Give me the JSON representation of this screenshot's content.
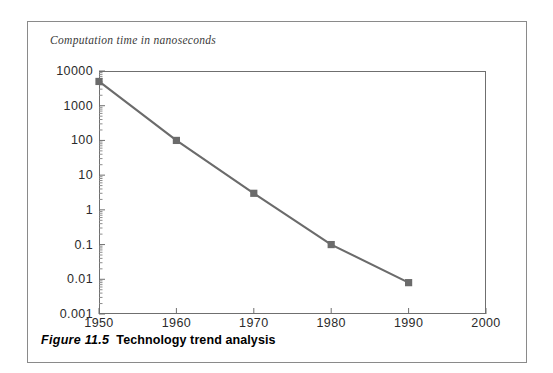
{
  "figure": {
    "caption_number": "Figure 11.5",
    "caption_text": "Technology trend analysis"
  },
  "chart_data": {
    "type": "line",
    "title": "Computation time in nanoseconds",
    "xlabel": "",
    "ylabel": "Computation time in nanoseconds",
    "yscale": "log",
    "xscale": "linear",
    "xlim": [
      1950,
      2000
    ],
    "ylim": [
      0.001,
      10000
    ],
    "grid": false,
    "legend": "none",
    "x_ticks": [
      "1950",
      "1960",
      "1970",
      "1980",
      "1990",
      "2000"
    ],
    "x_tick_values": [
      1950,
      1960,
      1970,
      1980,
      1990,
      2000
    ],
    "y_ticks": [
      "10000",
      "1000",
      "100",
      "10",
      "1",
      "0.1",
      "0.01",
      "0.001"
    ],
    "y_tick_values": [
      10000,
      1000,
      100,
      10,
      1,
      0.1,
      0.01,
      0.001
    ],
    "x": [
      1950,
      1960,
      1970,
      1980,
      1990
    ],
    "values": [
      5000,
      100,
      3,
      0.1,
      0.008
    ],
    "series": [
      {
        "name": "Computation time",
        "x": [
          1950,
          1960,
          1970,
          1980,
          1990
        ],
        "values": [
          5000,
          100,
          3,
          0.1,
          0.008
        ],
        "color": "#6b6b6b",
        "marker": "square"
      }
    ],
    "colors": {
      "line": "#6b6b6b",
      "marker": "#6b6b6b",
      "axis": "#6f6f6f",
      "text": "#2b2b2b",
      "frame": "#8a8a8a"
    }
  }
}
